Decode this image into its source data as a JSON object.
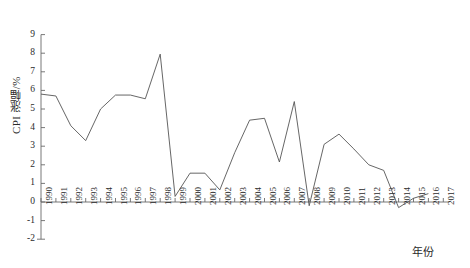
{
  "chart_data": {
    "type": "line",
    "title": "",
    "xlabel": "年份",
    "ylabel": "CPI 涨幅/%",
    "xlim": [
      1990,
      2017
    ],
    "ylim": [
      -2,
      9
    ],
    "grid": false,
    "legend": "none",
    "x": [
      1990,
      1991,
      1992,
      1993,
      1994,
      1995,
      1996,
      1997,
      1998,
      1999,
      2000,
      2001,
      2002,
      2003,
      2004,
      2005,
      2006,
      2007,
      2008,
      2009,
      2010,
      2011,
      2012,
      2013,
      2014,
      2015,
      2016
    ],
    "categories": [
      "1990",
      "1991",
      "1992",
      "1993",
      "1994",
      "1995",
      "1996",
      "1997",
      "1998",
      "1999",
      "2000",
      "2001",
      "2002",
      "2003",
      "2004",
      "2005",
      "2006",
      "2007",
      "2008",
      "2009",
      "2010",
      "2011",
      "2012",
      "2013",
      "2014",
      "2015",
      "2016"
    ],
    "values": [
      5.8,
      5.7,
      4.1,
      3.3,
      5.0,
      5.75,
      5.75,
      5.55,
      7.95,
      0.3,
      1.55,
      1.55,
      0.65,
      2.65,
      4.4,
      4.5,
      2.15,
      5.4,
      -0.2,
      3.1,
      3.65,
      2.85,
      2.0,
      1.7,
      -0.3,
      0.2,
      0.45
    ],
    "series": [
      {
        "name": "CPI 涨幅",
        "color": "#555555",
        "values": [
          5.8,
          5.7,
          4.1,
          3.3,
          5.0,
          5.75,
          5.75,
          5.55,
          7.95,
          0.3,
          1.55,
          1.55,
          0.65,
          2.65,
          4.4,
          4.5,
          2.15,
          5.4,
          -0.2,
          3.1,
          3.65,
          2.85,
          2.0,
          1.7,
          -0.3,
          0.2,
          0.45
        ]
      }
    ],
    "ytick_labels": [
      "9",
      "8",
      "7",
      "6",
      "5",
      "4",
      "3",
      "2",
      "1",
      "0",
      "-1",
      "-2"
    ],
    "ytick_values": [
      9,
      8,
      7,
      6,
      5,
      4,
      3,
      2,
      1,
      0,
      -1,
      -2
    ],
    "xtick_labels": [
      "1990",
      "1991",
      "1992",
      "1993",
      "1994",
      "1995",
      "1996",
      "1997",
      "1998",
      "1999",
      "2000",
      "2001",
      "2002",
      "2003",
      "2004",
      "2005",
      "2006",
      "2007",
      "2008",
      "2009",
      "2010",
      "2011",
      "2012",
      "2013",
      "2014",
      "2015",
      "2016",
      "2017"
    ],
    "axis_color": "#6a6a6a",
    "line_color": "#555555"
  }
}
